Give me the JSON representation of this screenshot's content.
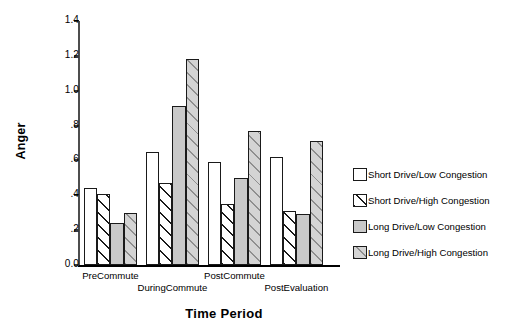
{
  "chart_data": {
    "type": "bar",
    "title": "",
    "xlabel": "Time Period",
    "ylabel": "Anger",
    "categories": [
      "PreCommute",
      "DuringCommute",
      "PostCommute",
      "PostEvaluation"
    ],
    "series": [
      {
        "name": "Short Drive/Low Congestion",
        "values": [
          0.44,
          0.65,
          0.59,
          0.62
        ],
        "fill": "white",
        "color": "#ffffff"
      },
      {
        "name": "Short Drive/High Congestion",
        "values": [
          0.41,
          0.47,
          0.35,
          0.31
        ],
        "fill": "white-hatch",
        "color": "#ffffff"
      },
      {
        "name": "Long Drive/Low Congestion",
        "values": [
          0.24,
          0.91,
          0.5,
          0.29
        ],
        "fill": "gray",
        "color": "#c9c9c9"
      },
      {
        "name": "Long Drive/High Congestion",
        "values": [
          0.3,
          1.18,
          0.77,
          0.71
        ],
        "fill": "gray-hatch",
        "color": "#d4d4d4"
      }
    ],
    "ylim": [
      0.0,
      1.4
    ],
    "yticks": [
      "0.0",
      ".2",
      ".4",
      ".6",
      ".8",
      "1.0",
      "1.2",
      "1.4"
    ],
    "ytick_values": [
      0.0,
      0.2,
      0.4,
      0.6,
      0.8,
      1.0,
      1.2,
      1.4
    ],
    "grid": false,
    "legend_position": "right"
  },
  "legend": {
    "items": [
      {
        "label": "Short Drive/Low Congestion"
      },
      {
        "label": "Short Drive/High Congestion"
      },
      {
        "label": "Long Drive/Low Congestion"
      },
      {
        "label": "Long Drive/High Congestion"
      }
    ]
  }
}
